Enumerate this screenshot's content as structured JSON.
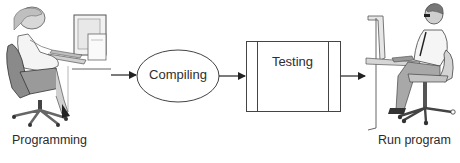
{
  "diagram": {
    "title": "",
    "stages": [
      {
        "id": "programming",
        "label": "Programming",
        "shape": "illustration-person-at-computer"
      },
      {
        "id": "compiling",
        "label": "Compiling",
        "shape": "ellipse"
      },
      {
        "id": "testing",
        "label": "Testing",
        "shape": "predefined-process-box"
      },
      {
        "id": "run",
        "label": "Run program",
        "shape": "illustration-person-at-computer"
      }
    ],
    "edges": [
      {
        "from": "programming",
        "to": "compiling"
      },
      {
        "from": "compiling",
        "to": "testing"
      },
      {
        "from": "testing",
        "to": "run"
      }
    ],
    "colors": {
      "stroke": "#333333",
      "text": "#2e2e2e",
      "chair": "#8a8a8a",
      "background": "#ffffff"
    }
  }
}
